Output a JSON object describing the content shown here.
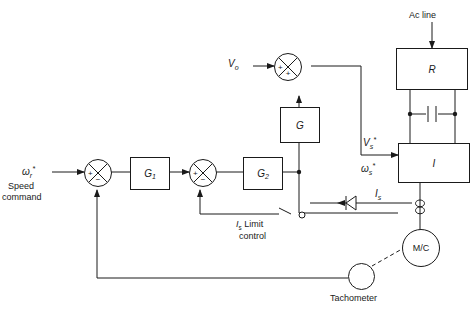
{
  "diagram": {
    "inputs": {
      "speed_command_symbol": "ω",
      "speed_command_sub": "r",
      "speed_command_sup": "*",
      "speed_command_label_line1": "Speed",
      "speed_command_label_line2": "command",
      "voltage_offset_symbol": "V",
      "voltage_offset_sub": "o",
      "ac_line_label": "Ac line"
    },
    "blocks": [
      {
        "id": "g1",
        "label": "G",
        "sub": "1",
        "name": "speed-controller-block"
      },
      {
        "id": "g2",
        "label": "G",
        "sub": "2",
        "name": "current-controller-block"
      },
      {
        "id": "g",
        "label": "G",
        "sub": "",
        "name": "voltage-gain-block"
      },
      {
        "id": "r",
        "label": "R",
        "sub": "",
        "name": "rectifier-block"
      },
      {
        "id": "i",
        "label": "I",
        "sub": "",
        "name": "inverter-block"
      }
    ],
    "summers": [
      {
        "id": "sum1",
        "left_sign": "+",
        "bottom_sign": "−",
        "name": "speed-error-summer"
      },
      {
        "id": "sum2",
        "left_sign": "+",
        "bottom_sign": "−",
        "name": "current-error-summer"
      },
      {
        "id": "sum3",
        "left_sign": "+",
        "bottom_sign": "+",
        "name": "voltage-command-summer"
      }
    ],
    "signals": {
      "voltage_command_symbol": "V",
      "voltage_command_sub": "s",
      "voltage_command_sup": "*",
      "slip_command_symbol": "ω",
      "slip_command_sub": "s",
      "slip_command_sup": "*",
      "current_feedback_symbol": "I",
      "current_feedback_sub": "s"
    },
    "limit_control": {
      "symbol": "I",
      "sub": "s",
      "text_line1": " Limit",
      "text_line2": "control",
      "switch_state": "open"
    },
    "machine": {
      "label": "M/C",
      "name": "induction-machine"
    },
    "tachometer": {
      "label": "Tachometer",
      "name": "tachometer"
    },
    "components": {
      "capacitor_name": "dc-link-capacitor",
      "diode_name": "diode",
      "current_sensor_name": "current-sensor"
    },
    "colors": {
      "line": "#1a1a1a",
      "background": "#ffffff",
      "text": "#1a1a1a"
    }
  }
}
